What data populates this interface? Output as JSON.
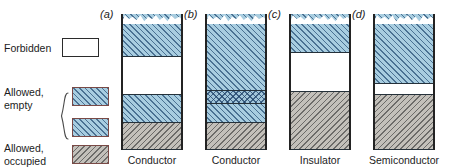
{
  "figure": {
    "key": {
      "title": "Key",
      "entries": [
        {
          "label": "Forbidden",
          "label_lines": [
            "Forbidden"
          ],
          "swatch": "white-empty-box",
          "color": "#ffffff"
        },
        {
          "label": "Allowed, empty",
          "label_lines": [
            "Allowed,",
            "empty"
          ],
          "swatch": "blue-hatched-box",
          "color": "#a8cde0",
          "count": 2
        },
        {
          "label": "Allowed, occupied",
          "label_lines": [
            "Allowed,",
            "occupied"
          ],
          "swatch": "gray-hatched-box",
          "color": "#c3c0ba"
        }
      ]
    },
    "columns": [
      {
        "letter": "(a)",
        "caption": "Conductor",
        "bands": [
          {
            "type": "allowed-empty",
            "fill": "blue",
            "top": 0,
            "height": 42,
            "jagged_top": true
          },
          {
            "type": "forbidden",
            "fill": "white",
            "top": 42,
            "height": 38
          },
          {
            "type": "allowed-empty",
            "fill": "blue",
            "top": 80,
            "height": 28
          },
          {
            "type": "allowed-occupied",
            "fill": "gray",
            "top": 108,
            "height": 28
          }
        ]
      },
      {
        "letter": "(b)",
        "caption": "Conductor",
        "bands": [
          {
            "type": "allowed-empty",
            "fill": "blue",
            "top": 0,
            "height": 76,
            "jagged_top": true
          },
          {
            "type": "overlapping-bands",
            "fill": "cross",
            "top": 76,
            "height": 13
          },
          {
            "type": "allowed-empty",
            "fill": "blue",
            "top": 89,
            "height": 19
          },
          {
            "type": "allowed-occupied",
            "fill": "gray",
            "top": 108,
            "height": 28
          }
        ]
      },
      {
        "letter": "(c)",
        "caption": "Insulator",
        "bands": [
          {
            "type": "allowed-empty",
            "fill": "blue",
            "top": 0,
            "height": 38,
            "jagged_top": true
          },
          {
            "type": "forbidden",
            "fill": "white",
            "top": 38,
            "height": 39
          },
          {
            "type": "allowed-occupied",
            "fill": "gray",
            "top": 77,
            "height": 59
          }
        ]
      },
      {
        "letter": "(d)",
        "caption": "Semiconductor",
        "bands": [
          {
            "type": "allowed-empty",
            "fill": "blue",
            "top": 0,
            "height": 69,
            "jagged_top": true
          },
          {
            "type": "forbidden",
            "fill": "white",
            "top": 69,
            "height": 11
          },
          {
            "type": "allowed-occupied",
            "fill": "gray",
            "top": 80,
            "height": 56
          }
        ]
      }
    ]
  }
}
